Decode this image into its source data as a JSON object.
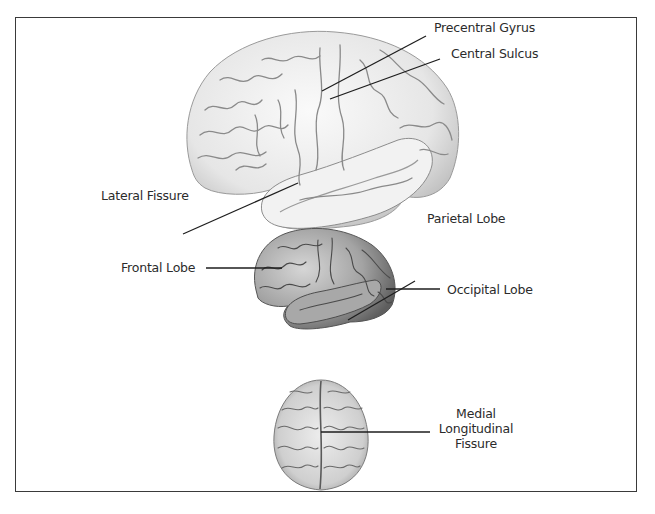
{
  "figure": {
    "type": "brain-anatomy-diagram",
    "views": [
      {
        "id": "lateral-large",
        "description": "Lateral view of left cerebral hemisphere (large)",
        "labels": [
          {
            "id": "precentral-gyrus",
            "text": "Precentral Gyrus"
          },
          {
            "id": "central-sulcus",
            "text": "Central Sulcus"
          },
          {
            "id": "lateral-fissure",
            "text": "Lateral Fissure"
          }
        ]
      },
      {
        "id": "lateral-small",
        "description": "Lateral view of left cerebral hemisphere (small, shaded)",
        "labels": [
          {
            "id": "parietal-lobe",
            "text": "Parietal Lobe"
          },
          {
            "id": "frontal-lobe",
            "text": "Frontal Lobe"
          },
          {
            "id": "occipital-lobe",
            "text": "Occipital Lobe"
          }
        ]
      },
      {
        "id": "superior",
        "description": "Superior (top-down) view of brain",
        "labels": [
          {
            "id": "medial-longitudinal-fissure",
            "lines": [
              "Medial",
              "Longitudinal",
              "Fissure"
            ]
          }
        ]
      }
    ]
  },
  "colors": {
    "frame": "#3a3a3a",
    "text": "#2b2b2b",
    "leader": "#1e1e1e",
    "brain_light": "#ececec",
    "brain_mid": "#bdbdbd",
    "brain_dark": "#6e6e6e"
  }
}
